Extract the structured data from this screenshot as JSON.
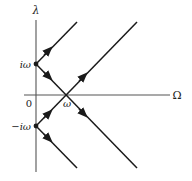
{
  "diagram": {
    "axes": {
      "y_label": "λ",
      "x_label": "Ω",
      "origin_label": "0"
    },
    "points": {
      "upper": {
        "label": "iω",
        "x": 36,
        "y": 64
      },
      "lower": {
        "label": "−iω",
        "x": 36,
        "y": 126
      },
      "crossing": {
        "label": "ω",
        "x": 66,
        "y": 95
      }
    },
    "branches": [
      {
        "from": "iω",
        "direction": "up-right",
        "arrow": "away from iω"
      },
      {
        "from": "iω",
        "direction": "down-right",
        "through": "ω",
        "arrow": "away from iω"
      },
      {
        "from": "−iω",
        "direction": "up-right",
        "through": "ω",
        "arrow": "away from −iω"
      },
      {
        "from": "−iω",
        "direction": "down-right",
        "arrow": "away from −iω"
      }
    ],
    "colors": {
      "line": "#1a1a1a",
      "axis": "#555555",
      "background": "#ffffff"
    }
  }
}
